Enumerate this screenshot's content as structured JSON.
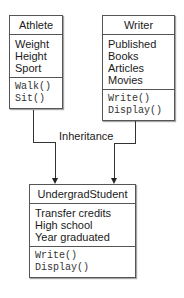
{
  "classes": {
    "athlete": {
      "name": "Athlete",
      "attributes": [
        "Weight",
        "Height",
        "Sport"
      ],
      "methods": [
        "Walk()",
        "Sit()"
      ]
    },
    "writer": {
      "name": "Writer",
      "attributes": [
        "Published",
        "Books",
        "Articles",
        "Movies"
      ],
      "methods": [
        "Write()",
        "Display()"
      ]
    },
    "undergrad": {
      "name": "UndergradStudent",
      "attributes": [
        "Transfer credits",
        "High school",
        "Year graduated"
      ],
      "methods": [
        "Write()",
        "Display()"
      ]
    }
  },
  "relation": {
    "label": "Inheritance"
  }
}
